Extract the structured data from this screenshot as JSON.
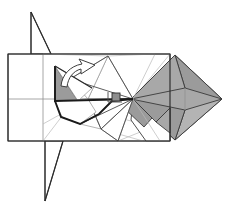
{
  "figure": {
    "kind": "origami-fold-diagram",
    "title": "Origami folding step diagram",
    "canvas": {
      "width": 227,
      "height": 209
    },
    "background_color": "#ffffff",
    "palette": {
      "paper_white": "#ffffff",
      "paper_gray": "#a8a8a8",
      "paper_gray_dark": "#9b9b9b",
      "paper_gray_light": "#b4b4b4",
      "edge_dark": "#1a1a1a",
      "edge_mid": "#3a3a3a",
      "crease_light": "#b9b9b9",
      "crease_mid": "#8f8f8f",
      "marker": "#8d8d8d"
    },
    "labels": {
      "sheet_outline": "paper-sheet-outline",
      "shaded_flap": "shaded-colored-side",
      "fold_arrow": "fold-direction-arrow",
      "reference_point": "reference-point-marker",
      "upper_spike": "upper-point-spike",
      "lower_spike": "lower-point-spike"
    },
    "geometry": {
      "sheet_rect": {
        "x": 8,
        "y": 54,
        "width": 162,
        "height": 87
      },
      "sheet_mid_horizontal_y": 99,
      "sheet_mid_vertical_x": 43,
      "convergence_point": {
        "x": 133,
        "y": 99
      },
      "right_tip": {
        "x": 222,
        "y": 99
      },
      "gray_diamond_top": {
        "x": 175,
        "y": 55
      },
      "gray_diamond_bottom": {
        "x": 175,
        "y": 140
      },
      "marker_square": {
        "x": 112,
        "y": 93,
        "size": 8
      }
    },
    "paths": {
      "sheet_border": "M8,54 L170,54 L170,141 L8,141 Z",
      "crease_vertical_left": "M43,54 L43,141",
      "crease_horizontal_mid": "M8,99 L170,99",
      "crease_vertical_right": "M170,54 L170,141",
      "upper_spike": "M31,12 L31,54 L51,54 Z",
      "lower_spike": "M45,201 L45,141 L63,141 Z",
      "spike_stem_up": "M31,12 L31,54",
      "spike_stem_down": "M45,141 L45,201",
      "gray_diamond_main": "M175,55 L222,99 L175,140 L131,99 Z",
      "gray_diamond_facet_upper": "M175,55 L222,99 L185,88 Z",
      "gray_diamond_facet_lower": "M175,140 L222,99 L185,110 Z",
      "gray_diamond_left_upper": "M175,55 L131,99 L185,88 Z",
      "gray_diamond_left_lower": "M175,140 L131,99 L185,110 Z",
      "gray_chevron": "M133,99 L155,121 L170,106 L170,141 L149,141 L133,118 Z",
      "gray_notch": "M133,99 L153,118 L140,131 L120,112 Z",
      "left_gray_triangle": "M55,66 L55,101 L78,101 Z",
      "left_flap_outline": "M55,66 L55,101 L62,117 L80,124 L96,112 L88,99 L78,101 Z",
      "bold_left_run": "M55,66 L55,101 L133,99",
      "bold_lower_run": "M55,101 L61,117 L80,124 L99,114 L112,101 L133,99",
      "white_kite_upper": "M108,56 L133,99 L88,99 Z",
      "white_kite_upper_b": "M108,56 L88,99 L70,79 Z",
      "crease_radial_1": "M133,99 L108,56",
      "crease_radial_2": "M133,99 L88,99",
      "crease_radial_3": "M133,99 L101,129",
      "crease_radial_4": "M133,99 L118,141",
      "crease_radial_5": "M133,99 L155,54",
      "crease_radial_6": "M133,99 L160,141",
      "crease_radial_7": "M133,99 L70,79",
      "crease_radial_8": "M133,99 L80,124",
      "crease_diag_a": "M43,54 L108,56",
      "crease_diag_b": "M70,79 L108,56",
      "crease_diag_c": "M88,99 L101,129",
      "crease_diag_d": "M101,129 L118,141",
      "crease_diag_e": "M112,101 L101,129",
      "crease_diag_f": "M96,112 L118,141",
      "crease_diag_g": "M88,99 L80,124",
      "crease_diag_h": "M55,101 L88,99",
      "crease_light_1": "M43,141 L108,56",
      "crease_light_2": "M170,54 L133,99",
      "crease_light_3": "M170,141 L133,99",
      "crease_light_4": "M96,112 L170,131",
      "crease_light_5": "M118,141 L170,120",
      "crease_light_6": "M108,56 L155,54",
      "arrow_outline": "M62,84 C64,74 72,66 84,65 L82,61 L95,66 L83,73 L84,69 C75,70 69,76 67,85 Z"
    }
  }
}
